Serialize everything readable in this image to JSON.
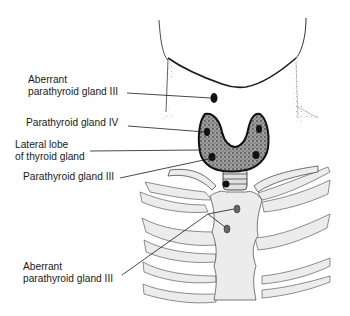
{
  "figure": {
    "type": "anatomical-illustration"
  },
  "labels": [
    {
      "id": "aberrant-parathyroid-iii-upper",
      "line1": "Aberrant",
      "line2": "parathyroid gland III"
    },
    {
      "id": "parathyroid-iv",
      "line1": "Parathyroid gland IV"
    },
    {
      "id": "lateral-lobe",
      "line1": "Lateral lobe",
      "line2": "of thyroid gland"
    },
    {
      "id": "parathyroid-iii",
      "line1": "Parathyroid gland III"
    },
    {
      "id": "aberrant-parathyroid-iii-lower",
      "line1": "Aberrant",
      "line2": "parathyroid gland III"
    }
  ],
  "colors": {
    "ink": "#1a1a1a",
    "gland_fill": "#8a8a8a",
    "bone_fill": "#ececec",
    "shade": "#c8c8c8"
  }
}
